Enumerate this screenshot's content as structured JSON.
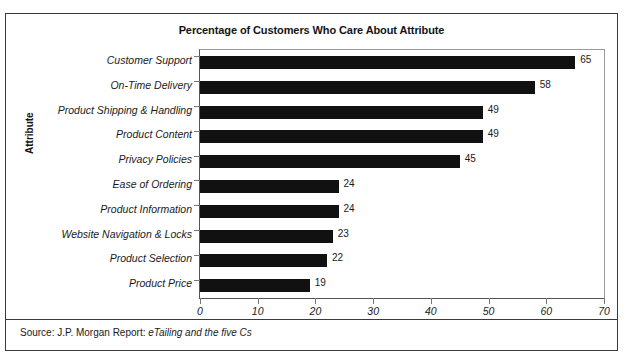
{
  "figure": {
    "source_prefix": "Source: J.P. Morgan Report:",
    "source_italic": "eTailing and the five Cs"
  },
  "chart_data": {
    "type": "bar",
    "orientation": "horizontal",
    "title": "Percentage of Customers Who Care About Attribute",
    "xlabel": "",
    "ylabel": "Attribute",
    "xlim": [
      0,
      70
    ],
    "xticks": [
      "0",
      "10",
      "20",
      "30",
      "40",
      "50",
      "60",
      "70"
    ],
    "xtick_values": [
      0,
      10,
      20,
      30,
      40,
      50,
      60,
      70
    ],
    "grid": false,
    "legend": "none",
    "bar_color": "#111111",
    "categories": [
      "Customer Support",
      "On-Time Delivery",
      "Product Shipping & Handling",
      "Product Content",
      "Privacy Policies",
      "Ease of Ordering",
      "Product Information",
      "Website Navigation & Locks",
      "Product Selection",
      "Product Price"
    ],
    "values": [
      65,
      58,
      49,
      49,
      45,
      24,
      24,
      23,
      22,
      19
    ],
    "data_labels": [
      "65",
      "58",
      "49",
      "49",
      "45",
      "24",
      "24",
      "23",
      "22",
      "19"
    ]
  }
}
